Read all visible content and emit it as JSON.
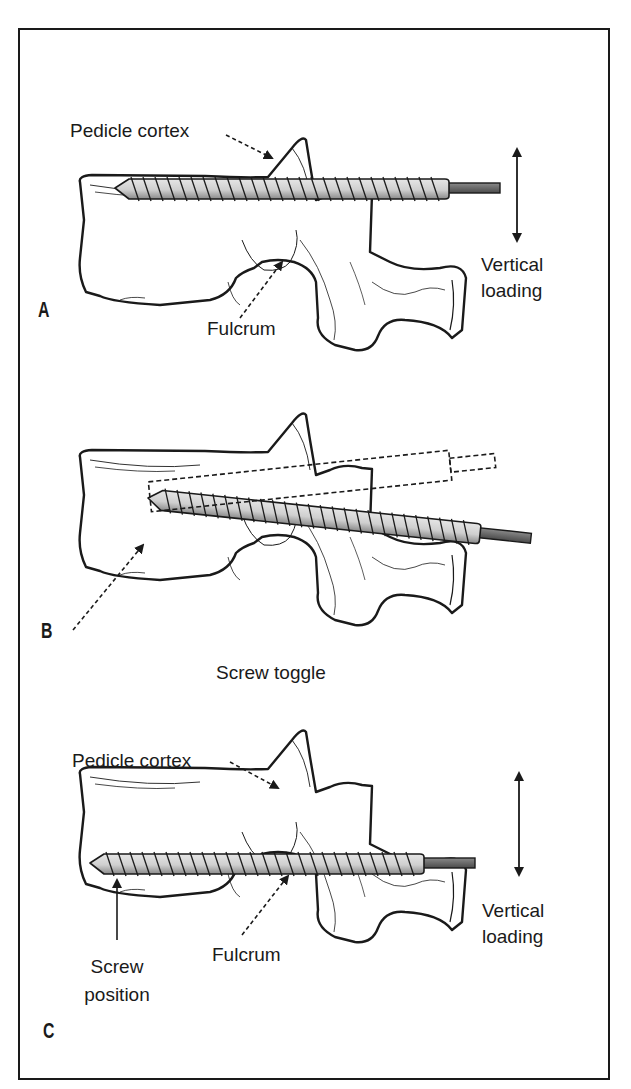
{
  "figure": {
    "panels": [
      {
        "letter": "A",
        "labels": {
          "pedicle_cortex": "Pedicle cortex",
          "fulcrum": "Fulcrum",
          "vertical_loading_line1": "Vertical",
          "vertical_loading_line2": "loading"
        }
      },
      {
        "letter": "B",
        "labels": {
          "caption": "Screw toggle"
        }
      },
      {
        "letter": "C",
        "labels": {
          "pedicle_cortex": "Pedicle cortex",
          "fulcrum": "Fulcrum",
          "vertical_loading_line1": "Vertical",
          "vertical_loading_line2": "loading",
          "screw_position_line1": "Screw",
          "screw_position_line2": "position"
        }
      }
    ],
    "colors": {
      "outline": "#1a1a1a",
      "screw_fill": "#cfcfcf",
      "screw_shadow": "#8a8a8a",
      "rod": "#6b6b6b",
      "background": "#ffffff"
    }
  }
}
